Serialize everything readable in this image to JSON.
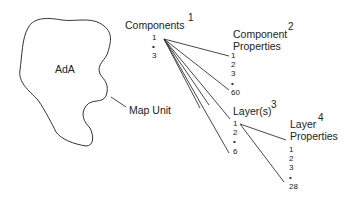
{
  "map_unit": {
    "symbol": "AdA",
    "label": "Map Unit"
  },
  "components": {
    "title": "Components",
    "number": "1",
    "items": [
      "1",
      "•",
      "3"
    ]
  },
  "component_properties": {
    "title_line1": "Component",
    "title_line2": "Properties",
    "number": "2",
    "items": [
      "1",
      "2",
      "3",
      "•",
      "60"
    ]
  },
  "layers": {
    "title": "Layer(s)",
    "number": "3",
    "items": [
      "1",
      "2",
      "•",
      "6"
    ]
  },
  "layer_properties": {
    "title_line1": "Layer",
    "title_line2": "Properties",
    "number": "4",
    "items": [
      "1",
      "2",
      "3",
      "•",
      "28"
    ]
  },
  "colors": {
    "line": "#333333",
    "text": "#222222",
    "background": "#ffffff"
  }
}
